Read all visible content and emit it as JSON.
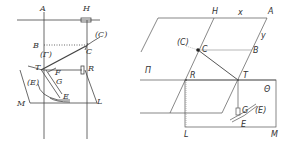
{
  "left_figure": {
    "labels": {
      "A": "A",
      "H": "H",
      "B": "B",
      "C": "C",
      "C_paren": "(C)",
      "Gamma": "(Γ)",
      "T": "T",
      "R": "R",
      "F": "F",
      "G": "G",
      "E": "E",
      "E_paren": "(E)",
      "M": "M",
      "L": "L"
    }
  },
  "right_figure": {
    "labels": {
      "H": "H",
      "x": "x",
      "A": "A",
      "y": "y",
      "C_paren": "(C)",
      "C": "C",
      "B": "B",
      "Pi": "Π",
      "R": "R",
      "T": "T",
      "Theta": "Θ",
      "G": "G",
      "E_paren": "(E)",
      "E": "E",
      "L": "L",
      "M": "M"
    }
  },
  "colors": {
    "line": "#333333",
    "faint": "#888888",
    "background": "#ffffff"
  }
}
